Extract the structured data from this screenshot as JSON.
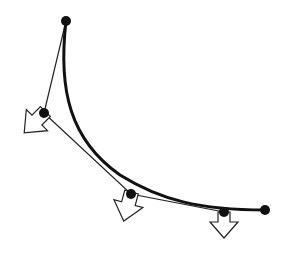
{
  "diagram": {
    "colors": {
      "stroke": "#111111",
      "background": "#ffffff",
      "arrow_fill": "#ffffff"
    },
    "points": [
      {
        "id": "p0",
        "x": 66,
        "y": 21
      },
      {
        "id": "p1",
        "x": 44,
        "y": 113
      },
      {
        "id": "p2",
        "x": 131,
        "y": 194
      },
      {
        "id": "p3",
        "x": 224,
        "y": 212
      },
      {
        "id": "p4",
        "x": 265,
        "y": 210
      }
    ],
    "arrows": [
      {
        "at": "p1",
        "direction": "down-left"
      },
      {
        "at": "p2",
        "direction": "down"
      },
      {
        "at": "p3",
        "direction": "down"
      }
    ]
  }
}
